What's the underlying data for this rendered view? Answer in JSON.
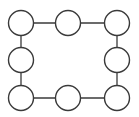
{
  "diagram": {
    "type": "ring-graph",
    "stroke_color": "#3a3a3a",
    "fill_color": "#ffffff",
    "node_radius": 12.5,
    "nodes": [
      {
        "id": "n1",
        "x": 21,
        "y": 23
      },
      {
        "id": "n2",
        "x": 68,
        "y": 23
      },
      {
        "id": "n3",
        "x": 117,
        "y": 23
      },
      {
        "id": "n4",
        "x": 117,
        "y": 60
      },
      {
        "id": "n5",
        "x": 117,
        "y": 98
      },
      {
        "id": "n6",
        "x": 68,
        "y": 98
      },
      {
        "id": "n7",
        "x": 21,
        "y": 98
      },
      {
        "id": "n8",
        "x": 21,
        "y": 60
      }
    ],
    "edges": [
      [
        "n1",
        "n2"
      ],
      [
        "n2",
        "n3"
      ],
      [
        "n3",
        "n4"
      ],
      [
        "n4",
        "n5"
      ],
      [
        "n5",
        "n6"
      ],
      [
        "n6",
        "n7"
      ],
      [
        "n7",
        "n8"
      ],
      [
        "n8",
        "n1"
      ]
    ]
  }
}
